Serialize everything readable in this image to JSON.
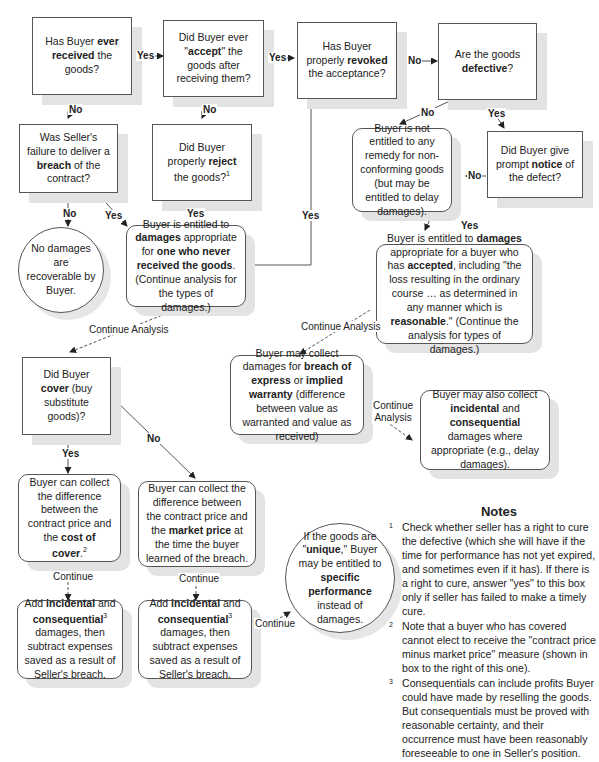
{
  "nodes": {
    "ever_received": {
      "pre": "Has Buyer ",
      "b1": "ever received",
      "post": " the goods?"
    },
    "accept": {
      "pre": "Did Buyer ever \"",
      "b1": "accept",
      "post": "\" the goods after receiving them?"
    },
    "revoked": {
      "pre": "Has Buyer properly ",
      "b1": "revoked",
      "post": " the acceptance?"
    },
    "defective": {
      "pre": "Are the goods ",
      "b1": "defective",
      "post": "?"
    },
    "breach": {
      "pre": "Was Seller's failure to deliver a ",
      "b1": "breach",
      "post": " of the contract?"
    },
    "reject": {
      "pre": "Did Buyer properly ",
      "b1": "reject",
      "post": " the goods?",
      "sup": "1"
    },
    "no_remedy": {
      "text": "Buyer is not entitled to any remedy for non-conforming goods (but may be entitled to delay damages)."
    },
    "notice": {
      "pre": "Did Buyer give prompt ",
      "b1": "notice",
      "post": " of the defect?"
    },
    "no_damages": {
      "text": "No damages are recoverable by Buyer."
    },
    "never_received_damages": {
      "pre": "Buyer is entitled to ",
      "b1": "damages",
      "mid": " appropriate for ",
      "b2": "one who never received the goods",
      "post": ". (Continue analysis for the types of damages.)"
    },
    "accepted_damages": {
      "pre": "Buyer is entitled to ",
      "b1": "damages",
      "mid": " appropriate for a buyer who has ",
      "b2": "accepted",
      "mid2": ", including \"the loss resulting in the ordinary course … as determined in any manner which is ",
      "b3": "reasonable",
      "post": ".\" (Continue the analysis for types of damages.)"
    },
    "warranty": {
      "pre": "Buyer may collect damages for ",
      "b1": "breach of express",
      "mid": " or ",
      "b2": "implied warranty",
      "post": " (difference between value as warranted and value as received)"
    },
    "incidental_also": {
      "pre": "Buyer may also collect ",
      "b1": "incidental",
      "mid": " and ",
      "b2": "consequential",
      "post": " damages where appropriate (e.g., delay damages)."
    },
    "cover": {
      "pre": "Did Buyer ",
      "b1": "cover",
      "post": " (buy substitute goods)?"
    },
    "cost_of_cover": {
      "pre": "Buyer can collect the difference between the contract price and the ",
      "b1": "cost of cover",
      "post": ".",
      "sup": "2"
    },
    "market_price": {
      "pre": "Buyer can collect the difference between the contract price and the ",
      "b1": "market price",
      "post": " at the time the buyer learned of the breach."
    },
    "add_incidental_1": {
      "pre": "Add ",
      "b1": "incidental",
      "mid": " and ",
      "b2": "consequential",
      "sup": "3",
      "post": " damages, then subtract expenses saved as a result of Seller's breach."
    },
    "add_incidental_2": {
      "pre": "Add ",
      "b1": "incidental",
      "mid": " and ",
      "b2": "consequential",
      "sup": "3",
      "post": " damages, then subtract expenses saved as a result of Seller's breach."
    },
    "unique": {
      "pre": "If the goods are \"",
      "b1": "unique",
      "mid": ",\" Buyer may be entitled to ",
      "b2": "specific performance",
      "post": " instead of damages."
    }
  },
  "edge_labels": {
    "yes": "Yes",
    "no": "No",
    "continue_analysis": "Continue Analysis",
    "continue_analysis_split": [
      "Continue",
      "Analysis"
    ],
    "continue": "Continue"
  },
  "notes": {
    "title": "Notes",
    "items": [
      {
        "num": "1",
        "text": "Check whether seller has a right to cure the defective (which she will have if the time for performance has not yet expired, and sometimes even if it has). If there is a right to cure, answer \"yes\" to this box only if seller has failed to make a timely cure."
      },
      {
        "num": "2",
        "text": "Note that a buyer who has covered cannot elect to receive the \"contract price minus market price\" measure (shown in box to the right of this one)."
      },
      {
        "num": "3",
        "text": "Consequentials can include profits Buyer could have made by reselling the goods. But consequentials must be proved with reasonable certainty, and their occurrence must have been reasonably foreseeable to one in Seller's position."
      }
    ]
  },
  "colors": {
    "line": "#444444",
    "shadow": "#e3e3e3",
    "text": "#222222"
  }
}
